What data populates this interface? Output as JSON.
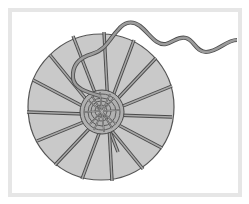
{
  "figure": {
    "subject": "Woven circular basket base with spokes and trailing yarn",
    "caption": ""
  },
  "colors": {
    "frame": "#e6e6e6",
    "background": "#ffffff",
    "disc_fill": "#c9c9c9",
    "disc_outline": "#555555",
    "spoke_fill": "#a8a8a8",
    "spoke_outline": "#4a4a4a",
    "yarn_fill": "#9c9c9c",
    "yarn_outline": "#4e4e4e",
    "weave_fill": "#b0b0b0"
  },
  "disc": {
    "cx": 101,
    "cy": 107,
    "r": 73
  },
  "weave_center": {
    "cx": 102,
    "cy": 112,
    "r": 22
  },
  "spokes": [
    {
      "x1": 73,
      "y1": 36,
      "x2": 118,
      "y2": 152
    },
    {
      "x1": 104,
      "y1": 32,
      "x2": 112,
      "y2": 181
    },
    {
      "x1": 134,
      "y1": 40,
      "x2": 82,
      "y2": 179
    },
    {
      "x1": 156,
      "y1": 58,
      "x2": 55,
      "y2": 165
    },
    {
      "x1": 172,
      "y1": 86,
      "x2": 37,
      "y2": 141
    },
    {
      "x1": 172,
      "y1": 117,
      "x2": 27,
      "y2": 112
    },
    {
      "x1": 162,
      "y1": 148,
      "x2": 33,
      "y2": 80
    },
    {
      "x1": 143,
      "y1": 169,
      "x2": 50,
      "y2": 55
    }
  ],
  "yarn": {
    "path": "M 100 96 C 86 92, 74 88, 73 78 C 72 66, 78 58, 92 54 C 106 50, 110 38, 118 30 C 124 22, 132 20, 140 26 C 150 34, 156 46, 166 44 C 174 42, 178 36, 186 38 C 194 40, 196 52, 206 52 C 218 52, 226 40, 237 40"
  }
}
